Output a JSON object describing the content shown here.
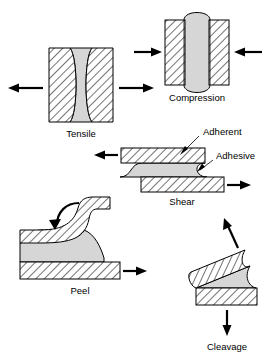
{
  "figure": {
    "background_color": "#ffffff",
    "adhesive_color": "#d6d6d6",
    "adherent_color": "#ffffff",
    "line_color": "#000000",
    "hatch_angle_deg": 45
  },
  "annotations": {
    "adherent_label": "Adherent",
    "adhesive_label": "Adhesive"
  },
  "panels": [
    {
      "key": "tensile",
      "caption": "Tensile",
      "adhesive_shape": "concave-hourglass",
      "arrows": [
        {
          "name": "tensile-arrow-left",
          "direction": "left"
        },
        {
          "name": "tensile-arrow-right",
          "direction": "right"
        }
      ]
    },
    {
      "key": "compression",
      "caption": "Compression",
      "adhesive_shape": "convex-bulge",
      "arrows": [
        {
          "name": "compression-arrow-left",
          "direction": "right"
        },
        {
          "name": "compression-arrow-right",
          "direction": "left"
        }
      ]
    },
    {
      "key": "shear",
      "caption": "Shear",
      "adhesive_shape": "s-curve-lap",
      "arrows": [
        {
          "name": "shear-arrow-top",
          "direction": "left"
        },
        {
          "name": "shear-arrow-bottom",
          "direction": "right"
        }
      ]
    },
    {
      "key": "peel",
      "caption": "Peel",
      "adhesive_shape": "peel-fillet",
      "arrows": [
        {
          "name": "peel-arrow-curved",
          "direction": "curl-left"
        },
        {
          "name": "peel-arrow-bottom",
          "direction": "right"
        }
      ]
    },
    {
      "key": "cleavage",
      "caption": "Cleavage",
      "adhesive_shape": "wedge",
      "arrows": [
        {
          "name": "cleavage-arrow-up",
          "direction": "up-right"
        },
        {
          "name": "cleavage-arrow-down",
          "direction": "down"
        }
      ]
    }
  ]
}
